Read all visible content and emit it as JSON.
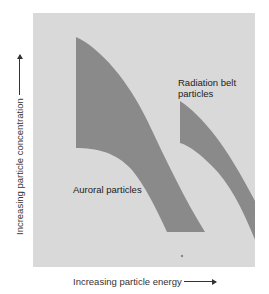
{
  "figure": {
    "panel_color": "#d9d9d9",
    "band_color": "#8a8a8a",
    "background_color": "#ffffff"
  },
  "axes": {
    "x_label": "Increasing particle energy",
    "y_label": "Increasing particle concentration"
  },
  "regions": [
    {
      "id": "auroral",
      "label": "Auroral particles"
    },
    {
      "id": "radiation_belt",
      "label_line1": "Radiation belt",
      "label_line2": "particles"
    }
  ]
}
